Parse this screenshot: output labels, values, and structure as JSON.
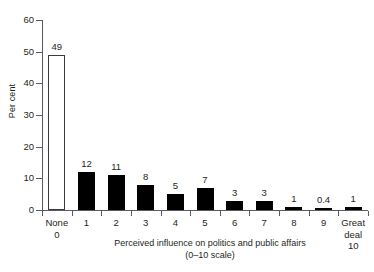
{
  "chart_data": {
    "type": "bar",
    "title": "",
    "xlabel": "Perceived influence on politics and public affairs (0–10 scale)",
    "ylabel": "Per cent",
    "categories": [
      "None",
      "1",
      "2",
      "3",
      "4",
      "5",
      "6",
      "7",
      "8",
      "9",
      "Great deal"
    ],
    "category_sublabels": [
      "0",
      "",
      "",
      "",
      "",
      "",
      "",
      "",
      "",
      "",
      "10"
    ],
    "values": [
      49,
      12,
      11,
      8,
      5,
      7,
      3,
      3,
      1,
      0.4,
      1
    ],
    "value_labels": [
      "49",
      "12",
      "11",
      "8",
      "5",
      "7",
      "3",
      "3",
      "1",
      "0.4",
      "1"
    ],
    "bar_styles": [
      "hollow",
      "filled",
      "filled",
      "filled",
      "filled",
      "filled",
      "filled",
      "filled",
      "filled",
      "filled",
      "filled"
    ],
    "ylim": [
      0,
      60
    ],
    "yticks": [
      0,
      10,
      20,
      30,
      40,
      50,
      60
    ],
    "ytick_labels": [
      "0",
      "10",
      "20",
      "30",
      "40",
      "50",
      "60"
    ],
    "grid": false,
    "legend": "none",
    "bar_fill_color": "#000000",
    "bar_outline_color": "#3a3a3c",
    "axis_color": "#5b5b5f",
    "text_color": "#231f20",
    "background_color": "#ffffff"
  }
}
